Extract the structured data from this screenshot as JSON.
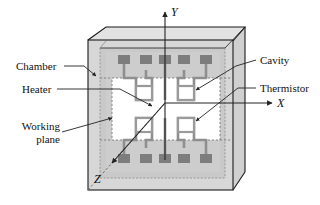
{
  "figure": {
    "name": "mems-thermal-chamber-schematic"
  },
  "axes": {
    "x_label": "X",
    "y_label": "Y",
    "z_label": "Z"
  },
  "callouts": [
    {
      "id": "chamber",
      "label": "Chamber",
      "side": "left"
    },
    {
      "id": "heater",
      "label": "Heater",
      "side": "left"
    },
    {
      "id": "working-plane",
      "label": "Working\nplane",
      "line1": "Working",
      "line2": "plane",
      "side": "left"
    },
    {
      "id": "cavity",
      "label": "Cavity",
      "side": "right"
    },
    {
      "id": "thermistor",
      "label": "Thermistor",
      "side": "right"
    }
  ],
  "colors": {
    "outline": "#1a1a1a",
    "chamber_face": "#cfcfcf",
    "chamber_side": "#c2c2c2",
    "working_plane": "#ffffff",
    "trace": "#8c8c8c",
    "pad": "#7d7d7d",
    "leader": "#333333",
    "dashed": "#777777",
    "background": "#ffffff"
  }
}
